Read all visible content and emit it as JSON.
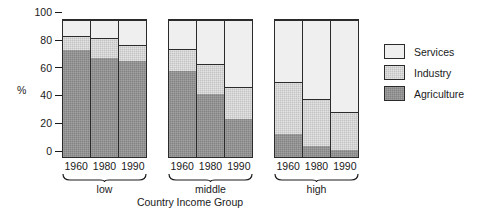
{
  "chart_data": {
    "type": "bar",
    "subtype": "stacked-bar-100-percent-grouped",
    "title": "",
    "xlabel": "Country Income Group",
    "ylabel": "%",
    "ylim": [
      0,
      100
    ],
    "yticks": [
      0,
      20,
      40,
      60,
      80,
      100
    ],
    "ytick_labels": [
      "0",
      "20",
      "40",
      "60",
      "80",
      "100"
    ],
    "grid": false,
    "legend_position": "right",
    "stack_order_bottom_to_top": [
      "Agriculture",
      "Industry",
      "Services"
    ],
    "groups": [
      "low",
      "middle",
      "high"
    ],
    "categories": [
      "1960",
      "1980",
      "1990"
    ],
    "series": [
      {
        "name": "Agriculture",
        "color": "#838383",
        "values": {
          "low": [
            78,
            72,
            70
          ],
          "middle": [
            63,
            46,
            28
          ],
          "high": [
            17,
            8,
            5
          ]
        }
      },
      {
        "name": "Industry",
        "color": "#c3c3c3",
        "values": {
          "low": [
            10,
            15,
            12
          ],
          "middle": [
            16,
            22,
            23
          ],
          "high": [
            38,
            34,
            28
          ]
        }
      },
      {
        "name": "Services",
        "color": "#efefef",
        "values": {
          "low": [
            12,
            13,
            18
          ],
          "middle": [
            21,
            32,
            49
          ],
          "high": [
            45,
            58,
            67
          ]
        }
      }
    ],
    "bars": [
      {
        "group": "low",
        "year": "1960",
        "agriculture": 78,
        "industry": 10,
        "services": 12
      },
      {
        "group": "low",
        "year": "1980",
        "agriculture": 72,
        "industry": 15,
        "services": 13
      },
      {
        "group": "low",
        "year": "1990",
        "agriculture": 70,
        "industry": 12,
        "services": 18
      },
      {
        "group": "middle",
        "year": "1960",
        "agriculture": 63,
        "industry": 16,
        "services": 21
      },
      {
        "group": "middle",
        "year": "1980",
        "agriculture": 46,
        "industry": 22,
        "services": 32
      },
      {
        "group": "middle",
        "year": "1990",
        "agriculture": 28,
        "industry": 23,
        "services": 49
      },
      {
        "group": "high",
        "year": "1960",
        "agriculture": 17,
        "industry": 38,
        "services": 45
      },
      {
        "group": "high",
        "year": "1980",
        "agriculture": 8,
        "industry": 34,
        "services": 58
      },
      {
        "group": "high",
        "year": "1990",
        "agriculture": 5,
        "industry": 28,
        "services": 67
      }
    ]
  },
  "axes": {
    "y_title": "%",
    "x_title": "Country Income Group",
    "y_tick_labels": [
      "100",
      "80",
      "60",
      "40",
      "20",
      "0"
    ]
  },
  "groups": [
    {
      "id": "low",
      "label": "low",
      "years": [
        "1960",
        "1980",
        "1990"
      ]
    },
    {
      "id": "middle",
      "label": "middle",
      "years": [
        "1960",
        "1980",
        "1990"
      ]
    },
    {
      "id": "high",
      "label": "high",
      "years": [
        "1960",
        "1980",
        "1990"
      ]
    }
  ],
  "legend": {
    "items": [
      {
        "label": "Services",
        "key": "services",
        "color": "#efefef"
      },
      {
        "label": "Industry",
        "key": "industry",
        "color": "#c3c3c3"
      },
      {
        "label": "Agriculture",
        "key": "agriculture",
        "color": "#838383"
      }
    ]
  }
}
